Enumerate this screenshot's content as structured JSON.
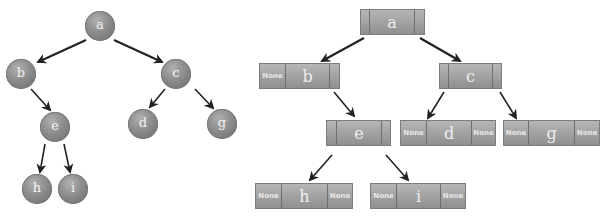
{
  "left_tree": {
    "nodes": [
      {
        "id": "a",
        "label": "a",
        "cx": 100,
        "cy": 26
      },
      {
        "id": "b",
        "label": "b",
        "cx": 21,
        "cy": 74
      },
      {
        "id": "c",
        "label": "c",
        "cx": 176,
        "cy": 74
      },
      {
        "id": "e",
        "label": "e",
        "cx": 55,
        "cy": 127
      },
      {
        "id": "d",
        "label": "d",
        "cx": 143,
        "cy": 124
      },
      {
        "id": "g",
        "label": "g",
        "cx": 222,
        "cy": 124
      },
      {
        "id": "h",
        "label": "h",
        "cx": 37,
        "cy": 189
      },
      {
        "id": "i",
        "label": "i",
        "cx": 73,
        "cy": 189
      }
    ],
    "edges": [
      {
        "from": "a",
        "to": "b"
      },
      {
        "from": "a",
        "to": "c"
      },
      {
        "from": "b",
        "to": "e"
      },
      {
        "from": "c",
        "to": "d"
      },
      {
        "from": "c",
        "to": "g"
      },
      {
        "from": "e",
        "to": "h"
      },
      {
        "from": "e",
        "to": "i"
      }
    ]
  },
  "right_tree": {
    "nodes": [
      {
        "id": "a",
        "label": "a",
        "left": "",
        "right": ""
      },
      {
        "id": "b",
        "label": "b",
        "left": "None",
        "right": ""
      },
      {
        "id": "c",
        "label": "c",
        "left": "",
        "right": ""
      },
      {
        "id": "e",
        "label": "e",
        "left": "",
        "right": ""
      },
      {
        "id": "d",
        "label": "d",
        "left": "None",
        "right": "None"
      },
      {
        "id": "g",
        "label": "g",
        "left": "None",
        "right": "None"
      },
      {
        "id": "h",
        "label": "h",
        "left": "None",
        "right": "None"
      },
      {
        "id": "i",
        "label": "i",
        "left": "None",
        "right": "None"
      }
    ],
    "edges": [
      {
        "from": "a",
        "to": "b"
      },
      {
        "from": "a",
        "to": "c"
      },
      {
        "from": "b",
        "to": "e"
      },
      {
        "from": "c",
        "to": "d"
      },
      {
        "from": "c",
        "to": "g"
      },
      {
        "from": "e",
        "to": "h"
      },
      {
        "from": "e",
        "to": "i"
      }
    ]
  }
}
